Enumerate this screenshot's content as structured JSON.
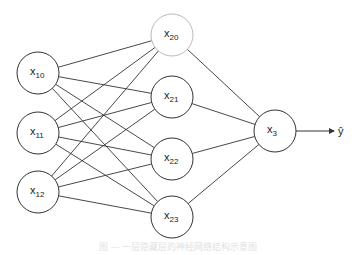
{
  "diagram": {
    "type": "neural-network",
    "colors": {
      "stroke": "#333333",
      "light_stroke": "#bbbbbb",
      "text": "#222222"
    },
    "layers": [
      {
        "name": "input",
        "nodes": [
          {
            "id": "x10",
            "base": "x",
            "sub": "10",
            "cx": 38,
            "cy": 73
          },
          {
            "id": "x11",
            "base": "x",
            "sub": "11",
            "cx": 38,
            "cy": 133
          },
          {
            "id": "x12",
            "base": "x",
            "sub": "12",
            "cx": 38,
            "cy": 192
          }
        ]
      },
      {
        "name": "hidden",
        "nodes": [
          {
            "id": "x20",
            "base": "x",
            "sub": "20",
            "cx": 172,
            "cy": 35,
            "light": true
          },
          {
            "id": "x21",
            "base": "x",
            "sub": "21",
            "cx": 172,
            "cy": 97
          },
          {
            "id": "x22",
            "base": "x",
            "sub": "22",
            "cx": 172,
            "cy": 159
          },
          {
            "id": "x23",
            "base": "x",
            "sub": "23",
            "cx": 172,
            "cy": 217
          }
        ]
      },
      {
        "name": "output",
        "nodes": [
          {
            "id": "x3",
            "base": "x",
            "sub": "3",
            "cx": 275,
            "cy": 131
          }
        ]
      }
    ],
    "radius": 21,
    "output_arrow": {
      "x1": 296,
      "y1": 131,
      "x2": 334,
      "y2": 131
    },
    "output_label": "ŷ",
    "caption": "图 — 一层隐藏层的神经网络结构示意图"
  }
}
